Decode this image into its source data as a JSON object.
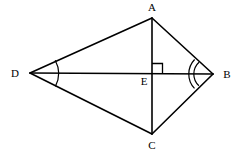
{
  "figure": {
    "name": "kite-abcd-with-diagonals",
    "type": "geometric-diagram",
    "shape": "kite",
    "width": 241,
    "height": 154,
    "background_color": "#ffffff",
    "stroke_color": "#000000",
    "stroke_width": 1.6,
    "label_color": "#000000",
    "label_font_size": 11
  },
  "vertices": {
    "A": {
      "label": "A",
      "x": 152,
      "y": 18,
      "label_x": 152,
      "label_y": 7,
      "role": "top-apex"
    },
    "B": {
      "label": "B",
      "x": 213,
      "y": 74,
      "label_x": 227,
      "label_y": 74,
      "role": "right-vertex"
    },
    "C": {
      "label": "C",
      "x": 152,
      "y": 134,
      "label_x": 152,
      "label_y": 145,
      "role": "bottom-apex"
    },
    "D": {
      "label": "D",
      "x": 30,
      "y": 73,
      "label_x": 15,
      "label_y": 73,
      "role": "left-vertex"
    },
    "E": {
      "label": "E",
      "x": 152,
      "y": 74,
      "label_x": 144,
      "label_y": 81,
      "role": "diagonal-intersection"
    }
  },
  "edges": [
    {
      "name": "side-DA",
      "from": "D",
      "to": "A"
    },
    {
      "name": "side-AB",
      "from": "A",
      "to": "B"
    },
    {
      "name": "side-BC",
      "from": "B",
      "to": "C"
    },
    {
      "name": "side-CD",
      "from": "C",
      "to": "D"
    }
  ],
  "diagonals": [
    {
      "name": "diagonal-AC",
      "from": "A",
      "to": "C",
      "orientation": "vertical"
    },
    {
      "name": "diagonal-DB",
      "from": "D",
      "to": "B",
      "orientation": "horizontal"
    }
  ],
  "markings": {
    "right_angle": {
      "name": "right-angle-marker-at-E",
      "at_vertex": "E",
      "quadrant": "upper-right",
      "size": 10,
      "measure": "90"
    },
    "angle_arcs": [
      {
        "name": "angle-arc-at-D",
        "at_vertex": "D",
        "count": 1,
        "radii": [
          28
        ],
        "meaning": "congruent-angle-mark-single"
      },
      {
        "name": "angle-arc-at-B",
        "at_vertex": "B",
        "count": 2,
        "radii": [
          16,
          21
        ],
        "meaning": "congruent-angle-mark-double"
      }
    ]
  }
}
